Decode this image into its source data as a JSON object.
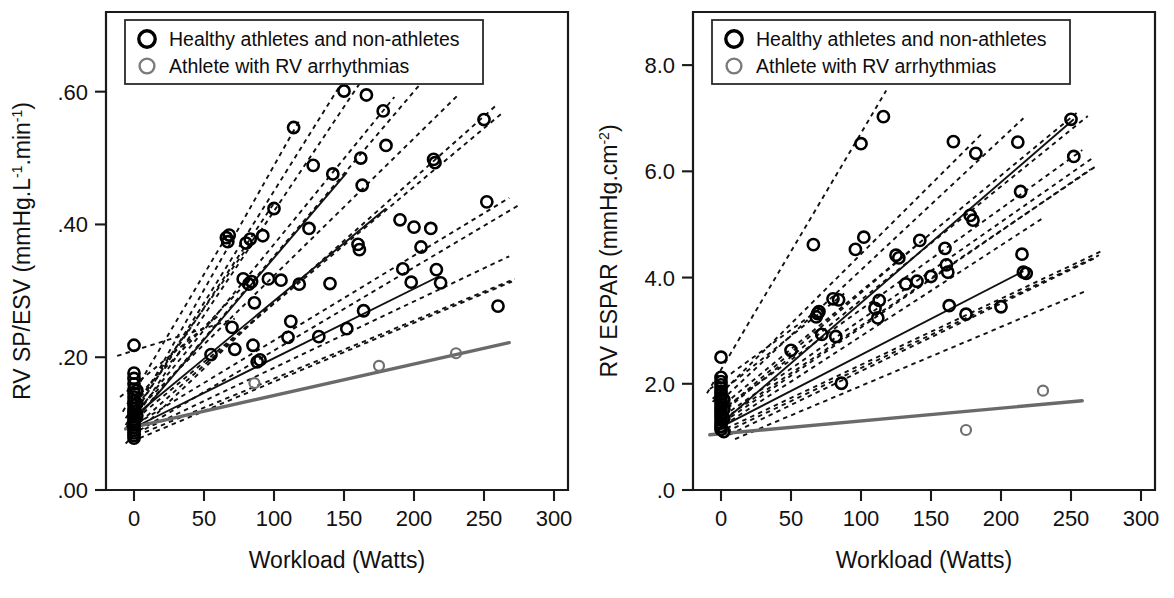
{
  "figure": {
    "panel_count": 2,
    "background": "#ffffff",
    "ink_color": "#111111",
    "patient_color": "#6f6f6f"
  },
  "legend": {
    "position": "top-left-inside",
    "entries": [
      {
        "marker": "bold-open-circle",
        "color": "#000000",
        "label": "Healthy athletes and non-athletes"
      },
      {
        "marker": "gray-open-circle",
        "color": "#7a7a7a",
        "label": "Athlete with RV arrhythmias"
      }
    ]
  },
  "chart_data": [
    {
      "type": "scatter",
      "panel": "left",
      "title": "",
      "xlabel": "Workload (Watts)",
      "ylabel": "RV SP/ESV (mmHg.L−1.min−1)",
      "ylabel_parts": {
        "base": "RV SP/ESV (mmHg.L",
        "sup1": "-1",
        "mid": ".min",
        "sup2": "-1",
        "tail": ")"
      },
      "xlim": [
        -20,
        310
      ],
      "ylim": [
        0.0,
        0.72
      ],
      "xticks": [
        0,
        50,
        100,
        150,
        200,
        250,
        300
      ],
      "xticklabels": [
        "0",
        "50",
        "100",
        "150",
        "200",
        "250",
        "300"
      ],
      "yticks": [
        0.0,
        0.2,
        0.4,
        0.6
      ],
      "yticklabels": [
        ".00",
        ".20",
        ".40",
        ".60"
      ],
      "grid": false,
      "series": [
        {
          "name": "Healthy athletes and non-athletes",
          "marker": "open-circle-black",
          "points": [
            [
              0,
              0.218
            ],
            [
              0,
              0.176
            ],
            [
              0,
              0.168
            ],
            [
              0,
              0.16
            ],
            [
              0,
              0.152
            ],
            [
              0,
              0.146
            ],
            [
              0,
              0.14
            ],
            [
              0,
              0.134
            ],
            [
              0,
              0.128
            ],
            [
              0,
              0.122
            ],
            [
              0,
              0.118
            ],
            [
              0,
              0.114
            ],
            [
              0,
              0.11
            ],
            [
              0,
              0.106
            ],
            [
              0,
              0.102
            ],
            [
              0,
              0.098
            ],
            [
              0,
              0.094
            ],
            [
              0,
              0.09
            ],
            [
              0,
              0.086
            ],
            [
              0,
              0.082
            ],
            [
              0,
              0.078
            ],
            [
              2,
              0.15
            ],
            [
              2,
              0.13
            ],
            [
              2,
              0.112
            ],
            [
              55,
              0.204
            ],
            [
              66,
              0.38
            ],
            [
              67,
              0.374
            ],
            [
              68,
              0.384
            ],
            [
              70,
              0.245
            ],
            [
              72,
              0.212
            ],
            [
              78,
              0.318
            ],
            [
              80,
              0.372
            ],
            [
              82,
              0.31
            ],
            [
              83,
              0.378
            ],
            [
              84,
              0.314
            ],
            [
              85,
              0.218
            ],
            [
              86,
              0.282
            ],
            [
              88,
              0.193
            ],
            [
              90,
              0.196
            ],
            [
              92,
              0.383
            ],
            [
              96,
              0.318
            ],
            [
              100,
              0.424
            ],
            [
              105,
              0.316
            ],
            [
              110,
              0.23
            ],
            [
              112,
              0.254
            ],
            [
              114,
              0.546
            ],
            [
              118,
              0.31
            ],
            [
              125,
              0.394
            ],
            [
              128,
              0.489
            ],
            [
              132,
              0.231
            ],
            [
              140,
              0.311
            ],
            [
              142,
              0.476
            ],
            [
              150,
              0.601
            ],
            [
              152,
              0.243
            ],
            [
              160,
              0.37
            ],
            [
              161,
              0.362
            ],
            [
              162,
              0.5
            ],
            [
              163,
              0.459
            ],
            [
              164,
              0.27
            ],
            [
              166,
              0.595
            ],
            [
              178,
              0.571
            ],
            [
              180,
              0.519
            ],
            [
              190,
              0.407
            ],
            [
              192,
              0.333
            ],
            [
              198,
              0.313
            ],
            [
              200,
              0.396
            ],
            [
              205,
              0.366
            ],
            [
              212,
              0.394
            ],
            [
              214,
              0.498
            ],
            [
              215,
              0.493
            ],
            [
              216,
              0.332
            ],
            [
              218,
              0.622
            ],
            [
              219,
              0.312
            ],
            [
              250,
              0.558
            ],
            [
              252,
              0.434
            ],
            [
              260,
              0.277
            ]
          ]
        },
        {
          "name": "Athlete with RV arrhythmias",
          "marker": "open-circle-gray",
          "points": [
            [
              86,
              0.161
            ],
            [
              175,
              0.187
            ],
            [
              230,
              0.206
            ]
          ]
        }
      ],
      "fit_lines": {
        "healthy_dashed": [
          {
            "x0": -12,
            "y0": 0.202,
            "x1": 72,
            "y1": 0.258
          },
          {
            "x0": -8,
            "y0": 0.118,
            "x1": 66,
            "y1": 0.382
          },
          {
            "x0": -6,
            "y0": 0.108,
            "x1": 90,
            "y1": 0.392
          },
          {
            "x0": -6,
            "y0": 0.098,
            "x1": 100,
            "y1": 0.432
          },
          {
            "x0": -6,
            "y0": 0.092,
            "x1": 118,
            "y1": 0.556
          },
          {
            "x0": -4,
            "y0": 0.1,
            "x1": 148,
            "y1": 0.612
          },
          {
            "x0": 0,
            "y0": 0.106,
            "x1": 170,
            "y1": 0.64
          },
          {
            "x0": 0,
            "y0": 0.112,
            "x1": 186,
            "y1": 0.592
          },
          {
            "x0": 0,
            "y0": 0.104,
            "x1": 224,
            "y1": 0.66
          },
          {
            "x0": 2,
            "y0": 0.12,
            "x1": 232,
            "y1": 0.596
          },
          {
            "x0": 0,
            "y0": 0.094,
            "x1": 258,
            "y1": 0.578
          },
          {
            "x0": 2,
            "y0": 0.108,
            "x1": 262,
            "y1": 0.566
          },
          {
            "x0": 2,
            "y0": 0.1,
            "x1": 268,
            "y1": 0.44
          },
          {
            "x0": 4,
            "y0": 0.09,
            "x1": 274,
            "y1": 0.428
          },
          {
            "x0": 2,
            "y0": 0.086,
            "x1": 268,
            "y1": 0.352
          },
          {
            "x0": 2,
            "y0": 0.082,
            "x1": 272,
            "y1": 0.318
          },
          {
            "x0": 4,
            "y0": 0.078,
            "x1": 270,
            "y1": 0.314
          },
          {
            "x0": -6,
            "y0": 0.07,
            "x1": 96,
            "y1": 0.276
          },
          {
            "x0": -4,
            "y0": 0.126,
            "x1": 84,
            "y1": 0.32
          },
          {
            "x0": -10,
            "y0": 0.14,
            "x1": 60,
            "y1": 0.262
          }
        ],
        "healthy_solid": [
          {
            "x0": 2,
            "y0": 0.108,
            "x1": 152,
            "y1": 0.478
          },
          {
            "x0": 2,
            "y0": 0.114,
            "x1": 180,
            "y1": 0.424
          },
          {
            "x0": 2,
            "y0": 0.096,
            "x1": 218,
            "y1": 0.322
          }
        ],
        "patient_solid": {
          "x0": -6,
          "y0": 0.092,
          "x1": 268,
          "y1": 0.222
        }
      }
    },
    {
      "type": "scatter",
      "panel": "right",
      "title": "",
      "xlabel": "Workload (Watts)",
      "ylabel": "RV ESPAR (mmHg.cm−2)",
      "ylabel_parts": {
        "base": "RV ESPAR (mmHg.cm",
        "sup1": "-2",
        "mid": "",
        "sup2": "",
        "tail": ")"
      },
      "xlim": [
        -20,
        310
      ],
      "ylim": [
        0.0,
        9.0
      ],
      "xticks": [
        0,
        50,
        100,
        150,
        200,
        250,
        300
      ],
      "xticklabels": [
        "0",
        "50",
        "100",
        "150",
        "200",
        "250",
        "300"
      ],
      "yticks": [
        0.0,
        2.0,
        4.0,
        6.0,
        8.0
      ],
      "yticklabels": [
        ".0",
        "2.0",
        "4.0",
        "6.0",
        "8.0"
      ],
      "grid": false,
      "series": [
        {
          "name": "Healthy athletes and non-athletes",
          "marker": "open-circle-black",
          "points": [
            [
              0,
              2.5
            ],
            [
              0,
              2.12
            ],
            [
              0,
              2.04
            ],
            [
              0,
              1.98
            ],
            [
              0,
              1.92
            ],
            [
              0,
              1.86
            ],
            [
              0,
              1.8
            ],
            [
              0,
              1.74
            ],
            [
              0,
              1.68
            ],
            [
              0,
              1.62
            ],
            [
              0,
              1.56
            ],
            [
              0,
              1.5
            ],
            [
              0,
              1.44
            ],
            [
              0,
              1.38
            ],
            [
              0,
              1.32
            ],
            [
              0,
              1.26
            ],
            [
              0,
              1.2
            ],
            [
              0,
              1.14
            ],
            [
              2,
              1.7
            ],
            [
              2,
              1.52
            ],
            [
              2,
              1.35
            ],
            [
              2,
              1.1
            ],
            [
              50,
              2.63
            ],
            [
              66,
              4.62
            ],
            [
              68,
              3.26
            ],
            [
              69,
              3.32
            ],
            [
              70,
              3.36
            ],
            [
              72,
              2.93
            ],
            [
              80,
              3.6
            ],
            [
              82,
              2.89
            ],
            [
              84,
              3.58
            ],
            [
              86,
              2.01
            ],
            [
              96,
              4.53
            ],
            [
              100,
              6.52
            ],
            [
              102,
              4.76
            ],
            [
              110,
              3.42
            ],
            [
              112,
              3.24
            ],
            [
              113,
              3.57
            ],
            [
              116,
              7.03
            ],
            [
              125,
              4.42
            ],
            [
              127,
              4.37
            ],
            [
              132,
              3.88
            ],
            [
              140,
              3.93
            ],
            [
              142,
              4.7
            ],
            [
              150,
              4.02
            ],
            [
              160,
              4.55
            ],
            [
              161,
              4.24
            ],
            [
              162,
              4.1
            ],
            [
              163,
              3.47
            ],
            [
              166,
              6.56
            ],
            [
              175,
              3.31
            ],
            [
              178,
              5.17
            ],
            [
              180,
              5.08
            ],
            [
              182,
              6.34
            ],
            [
              200,
              3.45
            ],
            [
              212,
              6.55
            ],
            [
              214,
              5.62
            ],
            [
              215,
              4.44
            ],
            [
              216,
              4.1
            ],
            [
              218,
              4.08
            ],
            [
              250,
              6.98
            ],
            [
              252,
              6.28
            ]
          ]
        },
        {
          "name": "Athlete with RV arrhythmias",
          "marker": "open-circle-gray",
          "points": [
            [
              175,
              1.13
            ],
            [
              230,
              1.87
            ]
          ]
        }
      ],
      "fit_lines": {
        "healthy_dashed": [
          {
            "x0": -10,
            "y0": 1.82,
            "x1": 118,
            "y1": 7.52
          },
          {
            "x0": -6,
            "y0": 1.66,
            "x1": 186,
            "y1": 6.7
          },
          {
            "x0": -4,
            "y0": 1.58,
            "x1": 216,
            "y1": 7.0
          },
          {
            "x0": -2,
            "y0": 1.52,
            "x1": 254,
            "y1": 7.1
          },
          {
            "x0": 0,
            "y0": 1.44,
            "x1": 262,
            "y1": 7.04
          },
          {
            "x0": 0,
            "y0": 1.5,
            "x1": 258,
            "y1": 6.4
          },
          {
            "x0": 2,
            "y0": 1.4,
            "x1": 266,
            "y1": 6.26
          },
          {
            "x0": 2,
            "y0": 1.34,
            "x1": 268,
            "y1": 6.1
          },
          {
            "x0": 2,
            "y0": 1.28,
            "x1": 264,
            "y1": 6.04
          },
          {
            "x0": 2,
            "y0": 1.22,
            "x1": 230,
            "y1": 5.12
          },
          {
            "x0": 4,
            "y0": 1.16,
            "x1": 272,
            "y1": 4.5
          },
          {
            "x0": 4,
            "y0": 1.1,
            "x1": 270,
            "y1": 4.42
          },
          {
            "x0": 6,
            "y0": 1.04,
            "x1": 268,
            "y1": 4.38
          },
          {
            "x0": 10,
            "y0": 0.96,
            "x1": 262,
            "y1": 3.76
          },
          {
            "x0": -6,
            "y0": 1.72,
            "x1": 88,
            "y1": 3.7
          },
          {
            "x0": -8,
            "y0": 1.9,
            "x1": 70,
            "y1": 3.4
          },
          {
            "x0": 0,
            "y0": 1.46,
            "x1": 142,
            "y1": 4.66
          }
        ],
        "healthy_solid": [
          {
            "x0": 4,
            "y0": 1.34,
            "x1": 252,
            "y1": 6.98
          },
          {
            "x0": 4,
            "y0": 1.24,
            "x1": 216,
            "y1": 4.12
          }
        ],
        "patient_solid": {
          "x0": -8,
          "y0": 1.04,
          "x1": 258,
          "y1": 1.68
        }
      }
    }
  ]
}
